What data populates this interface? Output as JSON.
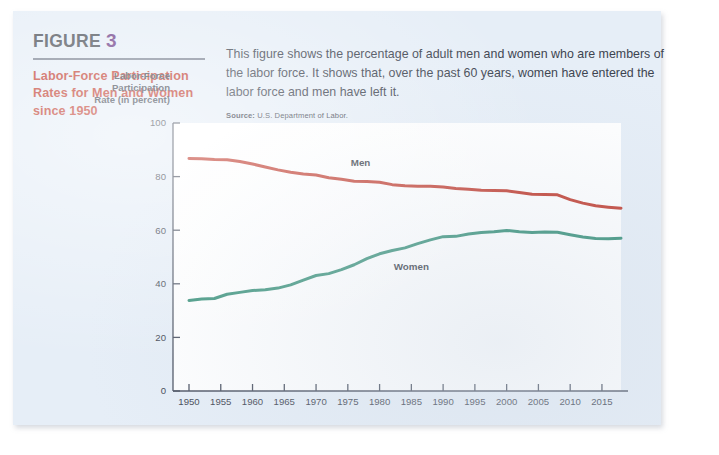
{
  "figure": {
    "label": "FIGURE",
    "number": "3",
    "title": "Labor-Force Participation Rates for Men and Women since 1950",
    "description": "This figure shows the percentage of adult men and women who are members of the labor force. It shows that, over the past 60 years, women have entered the labor force and men have left it.",
    "source_label": "Source:",
    "source_text": "U.S. Department of Labor."
  },
  "colors": {
    "card_background": "#e6eef7",
    "plot_background": "#ffffff",
    "figure_number": "#6b3a86",
    "figure_title": "#c0392b",
    "men_line": "#c0392b",
    "women_line": "#2e8b72",
    "axis": "#4a5160",
    "text": "#3d4450"
  },
  "chart_data": {
    "type": "line",
    "title": "Labor-Force Participation Rates for Men and Women since 1950",
    "xlabel": "",
    "ylabel": "Labor-Force Participation Rate (in percent)",
    "ylabel_lines": [
      "Labor-Force",
      "Participation",
      "Rate (in percent)"
    ],
    "xlim": [
      1948,
      2018
    ],
    "ylim": [
      0,
      100
    ],
    "yticks": [
      0,
      20,
      40,
      60,
      80,
      100
    ],
    "ytick_labels": [
      "0",
      "20",
      "40",
      "60",
      "80",
      "100"
    ],
    "xticks": [
      1950,
      1955,
      1960,
      1965,
      1970,
      1975,
      1980,
      1985,
      1990,
      1995,
      2000,
      2005,
      2010,
      2015
    ],
    "xtick_labels": [
      "1950",
      "1955",
      "1960",
      "1965",
      "1970",
      "1975",
      "1980",
      "1985",
      "1990",
      "1995",
      "2000",
      "2005",
      "2010",
      "2015"
    ],
    "grid": false,
    "legend": "inline-labels",
    "annotations": [
      {
        "text": "Men",
        "x": 1977,
        "y": 84
      },
      {
        "text": "Women",
        "x": 1985,
        "y": 45
      }
    ],
    "x": [
      1950,
      1952,
      1954,
      1956,
      1958,
      1960,
      1962,
      1964,
      1966,
      1968,
      1970,
      1972,
      1974,
      1976,
      1978,
      1980,
      1982,
      1984,
      1986,
      1988,
      1990,
      1992,
      1994,
      1996,
      1998,
      2000,
      2002,
      2004,
      2006,
      2008,
      2010,
      2012,
      2014,
      2016,
      2018
    ],
    "series": [
      {
        "name": "Men",
        "color": "#c0392b",
        "values": [
          86.8,
          86.7,
          86.4,
          86.3,
          85.6,
          84.7,
          83.6,
          82.5,
          81.6,
          81.0,
          80.6,
          79.6,
          79.0,
          78.3,
          78.2,
          77.9,
          77.0,
          76.6,
          76.4,
          76.4,
          76.1,
          75.6,
          75.3,
          74.9,
          74.8,
          74.7,
          74.1,
          73.4,
          73.3,
          73.2,
          71.4,
          70.1,
          69.1,
          68.6,
          68.2
        ]
      },
      {
        "name": "Women",
        "color": "#2e8b72",
        "values": [
          33.8,
          34.3,
          34.5,
          36.1,
          36.8,
          37.5,
          37.8,
          38.4,
          39.6,
          41.4,
          43.1,
          43.8,
          45.3,
          47.1,
          49.4,
          51.2,
          52.4,
          53.4,
          55.0,
          56.4,
          57.6,
          57.7,
          58.6,
          59.1,
          59.4,
          59.9,
          59.4,
          59.1,
          59.3,
          59.2,
          58.3,
          57.5,
          56.9,
          56.8,
          57.0
        ]
      }
    ]
  }
}
